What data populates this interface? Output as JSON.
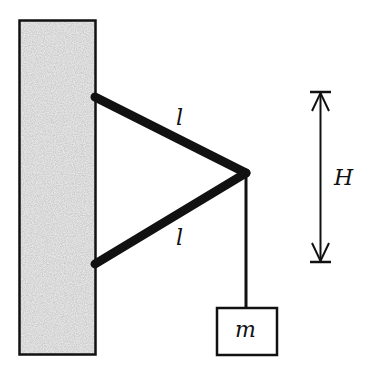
{
  "diagram": {
    "labels": {
      "upper_rod": "l",
      "lower_rod": "l",
      "height": "H",
      "mass": "m"
    },
    "colors": {
      "ink": "#111111",
      "wall_fill": "#d4d4d4"
    }
  }
}
